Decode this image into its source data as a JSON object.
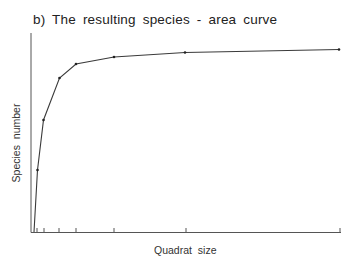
{
  "chart_data": {
    "type": "line",
    "title": "b) The  resulting  species - area  curve",
    "xlabel": "Quadrat  size",
    "ylabel": "Species  number",
    "grid": false,
    "legend": null,
    "x_ticks_px": [
      37,
      44,
      59,
      76,
      114,
      186,
      340
    ],
    "points_relative": [
      {
        "x": 0.0,
        "y": 0.0
      },
      {
        "x": 0.5,
        "y": 0.31
      },
      {
        "x": 1,
        "y": 0.56
      },
      {
        "x": 2,
        "y": 0.77
      },
      {
        "x": 4,
        "y": 0.84
      },
      {
        "x": 8,
        "y": 0.875
      },
      {
        "x": 16,
        "y": 0.898
      },
      {
        "x": 32,
        "y": 0.915
      }
    ],
    "points_px": [
      [
        34,
        232
      ],
      [
        37.5,
        170
      ],
      [
        43.5,
        120
      ],
      [
        59.5,
        78
      ],
      [
        76,
        64
      ],
      [
        114,
        57
      ],
      [
        185,
        52.5
      ],
      [
        339,
        49.5
      ]
    ],
    "axis": {
      "origin_px": [
        31,
        232
      ],
      "y_top_px": 33,
      "x_end_px": 341
    },
    "colors": {
      "line": "#3a3a3a",
      "axis": "#555555",
      "text": "#2a2a2a"
    }
  }
}
